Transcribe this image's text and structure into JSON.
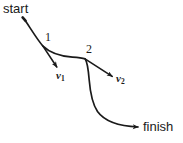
{
  "figure": {
    "type": "trajectory-diagram",
    "background_color": "#ffffff",
    "stroke_color": "#1a1a1a",
    "labels": {
      "start": "start",
      "finish": "finish",
      "point1": "1",
      "point2": "2",
      "v1_symbol": "v",
      "v1_subscript": "1",
      "v2_symbol": "v",
      "v2_subscript": "2"
    },
    "geometry": {
      "path_start_point": "24,19",
      "point1_position": "43,46",
      "point2_position": "85,58",
      "path_finish_point": "140,127",
      "v1_arrow_from": "43,46",
      "v1_arrow_to": "58,68",
      "v2_arrow_from": "85,59",
      "v2_arrow_to": "114,77"
    }
  }
}
